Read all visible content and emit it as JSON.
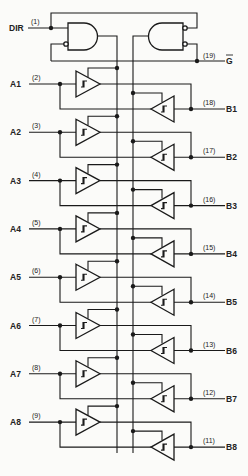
{
  "diagram": {
    "type": "logic-schematic",
    "control": {
      "dir": {
        "label": "DIR",
        "pin": "(1)"
      },
      "enable": {
        "label": "G",
        "pin": "(19)",
        "active_low": true
      }
    },
    "channels": [
      {
        "a_label": "A1",
        "a_pin": "(2)",
        "b_label": "B1",
        "b_pin": "(18)"
      },
      {
        "a_label": "A2",
        "a_pin": "(3)",
        "b_label": "B2",
        "b_pin": "(17)"
      },
      {
        "a_label": "A3",
        "a_pin": "(4)",
        "b_label": "B3",
        "b_pin": "(16)"
      },
      {
        "a_label": "A4",
        "a_pin": "(5)",
        "b_label": "B4",
        "b_pin": "(15)"
      },
      {
        "a_label": "A5",
        "a_pin": "(6)",
        "b_label": "B5",
        "b_pin": "(14)"
      },
      {
        "a_label": "A6",
        "a_pin": "(7)",
        "b_label": "B6",
        "b_pin": "(13)"
      },
      {
        "a_label": "A7",
        "a_pin": "(8)",
        "b_label": "B7",
        "b_pin": "(12)"
      },
      {
        "a_label": "A8",
        "a_pin": "(9)",
        "b_label": "B8",
        "b_pin": "(11)"
      }
    ],
    "colors": {
      "ink": "#1a1a1a",
      "paper": "#fbfbf9"
    }
  }
}
